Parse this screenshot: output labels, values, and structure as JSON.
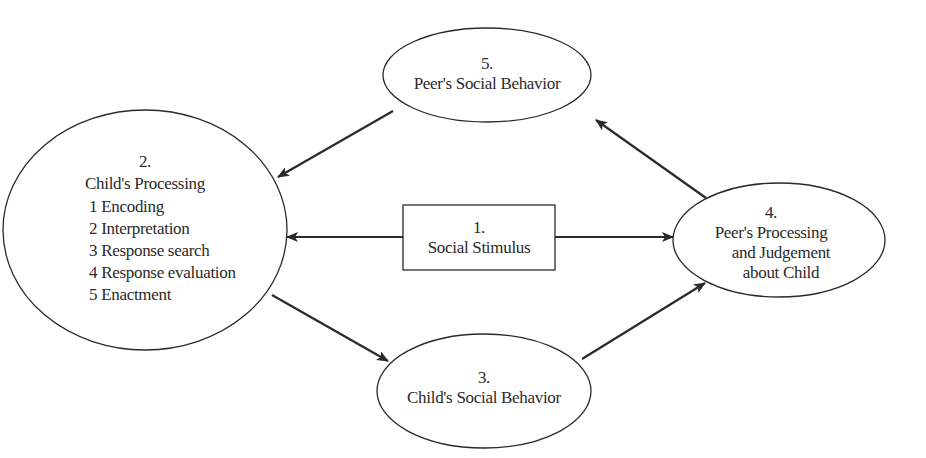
{
  "diagram": {
    "nodes": [
      {
        "id": "1",
        "number": "1.",
        "title": "Social Stimulus",
        "shape": "rectangle"
      },
      {
        "id": "2",
        "number": "2.",
        "title": "Child's Processing",
        "shape": "circle",
        "steps": [
          "1 Encoding",
          "2 Interpretation",
          "3 Response search",
          "4 Response evaluation",
          "5 Enactment"
        ]
      },
      {
        "id": "3",
        "number": "3.",
        "title": "Child's Social Behavior",
        "shape": "ellipse"
      },
      {
        "id": "4",
        "number": "4.",
        "title_lines": [
          "Peer's Processing",
          "and Judgement",
          "about Child"
        ],
        "shape": "ellipse"
      },
      {
        "id": "5",
        "number": "5.",
        "title": "Peer's Social Behavior",
        "shape": "ellipse"
      }
    ],
    "edges": [
      {
        "from": "1",
        "to": "2"
      },
      {
        "from": "1",
        "to": "4"
      },
      {
        "from": "2",
        "to": "3"
      },
      {
        "from": "3",
        "to": "4"
      },
      {
        "from": "4",
        "to": "5"
      },
      {
        "from": "5",
        "to": "2"
      }
    ],
    "colors": {
      "stroke": "#2a2a2a",
      "background": "#ffffff"
    }
  }
}
